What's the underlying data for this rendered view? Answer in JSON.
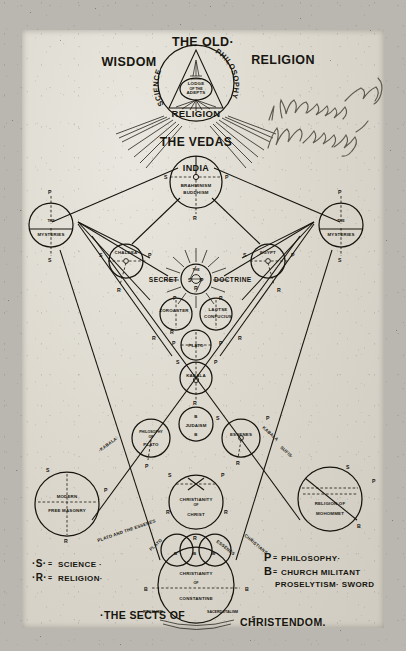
{
  "document": {
    "kind": "hand-drawn esoteric chart",
    "title_lines": [
      "THE OLD·",
      "WISDOM",
      "RELIGION"
    ],
    "handwritten_note": "\"Knowers\" Knowledge"
  },
  "titles": {
    "the_old": "THE OLD·",
    "wisdom": "WISDOM",
    "religion_title": "RELIGION",
    "the_vedas": "THE VEDAS",
    "sects_of": "·THE SECTS OF",
    "christendom": "CHRISTENDOM."
  },
  "crest": {
    "science": "SCIENCE",
    "philosophy": "PHILOSOPHY",
    "religion": "RELIGION",
    "inner": [
      "LODGE",
      "OF THE",
      "ADEPTS"
    ]
  },
  "nodes": {
    "india": {
      "label": "INDIA",
      "sub1": "BRAHMINISM",
      "sub2": "BUDDHISM",
      "marks": [
        "S",
        "P",
        "R"
      ]
    },
    "mysteries_left": {
      "line1": "THE",
      "line2": "MYSTERIES",
      "marks": [
        "P",
        "S"
      ]
    },
    "mysteries_right": {
      "line1": "THE",
      "line2": "MYSTERIES",
      "marks": [
        "P",
        "S"
      ]
    },
    "chaldea": {
      "label": "CHALDEA",
      "marks": [
        "S",
        "P",
        "R"
      ]
    },
    "egypt": {
      "label": "EGYPT",
      "marks": [
        "S",
        "P",
        "R"
      ]
    },
    "secret_doctrine": {
      "pre": "SECRET",
      "post": "DOCTRINE",
      "top": "THE",
      "marks": [
        "S",
        "P",
        "R"
      ]
    },
    "zoroaster": {
      "label": "ZOROASTER",
      "marks": [
        "P",
        "R"
      ]
    },
    "laotse": {
      "line1": "LAOTSE",
      "line2": "CONFUCIUS",
      "marks": [
        "P",
        "R"
      ]
    },
    "plato": {
      "label": "PLATO",
      "marks": [
        "P",
        "R",
        "P"
      ]
    },
    "kabala": {
      "label": "KABALA",
      "marks": [
        "S",
        "P",
        "R"
      ]
    },
    "judaism": {
      "label": "JUDAISM",
      "marks": [
        "B",
        "B"
      ]
    },
    "philosophy_of_plato": {
      "line1": "PHILOSOPHY",
      "line2": "OF",
      "line3": "PLATO",
      "marks": [
        "P"
      ]
    },
    "essenes": {
      "label": "ESSENES",
      "marks": [
        "S",
        "P",
        "R"
      ]
    },
    "modern_free_masonry": {
      "line1": "MODERN",
      "line2": "FREE MASONRY",
      "marks": [
        "S",
        "P",
        "R"
      ]
    },
    "religion_of_mohommet": {
      "line1": "RELIGION OF",
      "line2": "MOHOMMET",
      "marks": [
        "S",
        "P",
        "B"
      ]
    },
    "christianity_of_christ": {
      "line1": "CHRISTIANITY",
      "line2": "OF",
      "line3": "CHRIST",
      "marks": [
        "S",
        "P",
        "R",
        "R"
      ]
    },
    "christianity_of_constantine": {
      "line1": "CHRISTIANITY",
      "line2": "OF",
      "line3": "CONSTANTINE",
      "marks": [
        "B",
        "B",
        "B",
        "B",
        "B"
      ]
    },
    "sects_trio": {
      "marks": [
        "B",
        "B",
        "B"
      ]
    }
  },
  "diagonal_labels": {
    "kabala_left": "·KABALA·",
    "kabala_right": "KABALA",
    "sufis": "SUFIS·",
    "plato_and_the_essenes": "PLATO AND THE ESSENES",
    "plato_bottom": "PLATO",
    "essenes_bottom": "ESSENES",
    "christians_bottom": "CHRISTIANS",
    "ritualism": "RITUALISM",
    "sacerdotalism": "SACERDOTALISM"
  },
  "legend": {
    "left": [
      {
        "key": "·S·",
        "sep": "=",
        "value": "SCIENCE ·"
      },
      {
        "key": "·R·",
        "sep": "=",
        "value": "RELIGION·"
      }
    ],
    "right": [
      {
        "key": "P",
        "sep": "=",
        "value": "PHILOSOPHY·"
      },
      {
        "key": "B",
        "sep": "=",
        "value": "CHURCH MILITANT"
      },
      {
        "key": "",
        "sep": "",
        "value": "PROSELYTISM· SWORD"
      }
    ]
  },
  "colors": {
    "ink": "#16140e",
    "paper": "#ddd9cf",
    "pencil": "#5d5a52",
    "backdrop": "#b9b7b0"
  }
}
